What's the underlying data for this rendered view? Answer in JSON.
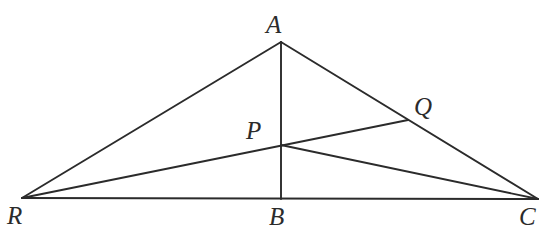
{
  "figure": {
    "type": "geometry-diagram",
    "width": 559,
    "height": 238,
    "background_color": "#ffffff",
    "stroke_color": "#2b2b2b",
    "label_color": "#2b2b2b",
    "stroke_width": 1.9,
    "label_font_size": 25
  },
  "points": [
    {
      "id": "A",
      "label": "A",
      "x": 281,
      "y": 42,
      "label_x": 266,
      "label_y": 12,
      "role": "apex-vertex"
    },
    {
      "id": "R",
      "label": "R",
      "x": 22,
      "y": 198,
      "label_x": 7,
      "label_y": 203,
      "role": "base-left-vertex"
    },
    {
      "id": "C",
      "label": "C",
      "x": 538,
      "y": 199,
      "label_x": 519,
      "label_y": 204,
      "role": "base-right-vertex"
    },
    {
      "id": "B",
      "label": "B",
      "x": 281,
      "y": 199,
      "label_x": 269,
      "label_y": 204,
      "role": "foot-of-altitude"
    },
    {
      "id": "P",
      "label": "P",
      "x": 281,
      "y": 145,
      "label_x": 246,
      "label_y": 118,
      "role": "interior-intersection"
    },
    {
      "id": "Q",
      "label": "Q",
      "x": 408,
      "y": 120,
      "label_x": 414,
      "label_y": 94,
      "role": "point-on-side-AC"
    }
  ],
  "segments": [
    {
      "id": "RA",
      "from": "R",
      "to": "A",
      "name": "side-RA",
      "x1": 22,
      "y1": 198,
      "x2": 281,
      "y2": 42
    },
    {
      "id": "AC",
      "from": "A",
      "to": "C",
      "name": "side-AC",
      "x1": 281,
      "y1": 42,
      "x2": 538,
      "y2": 199
    },
    {
      "id": "RC",
      "from": "R",
      "to": "C",
      "name": "base-RC",
      "x1": 22,
      "y1": 198,
      "x2": 538,
      "y2": 199
    },
    {
      "id": "AB",
      "from": "A",
      "to": "B",
      "name": "altitude-AB",
      "x1": 281,
      "y1": 42,
      "x2": 281,
      "y2": 199
    },
    {
      "id": "RQ",
      "from": "R",
      "to": "Q",
      "name": "cevian-RQ",
      "x1": 22,
      "y1": 198,
      "x2": 408,
      "y2": 120
    },
    {
      "id": "PC",
      "from": "P",
      "to": "C",
      "name": "cevian-PC",
      "x1": 281,
      "y1": 145,
      "x2": 538,
      "y2": 199
    }
  ]
}
